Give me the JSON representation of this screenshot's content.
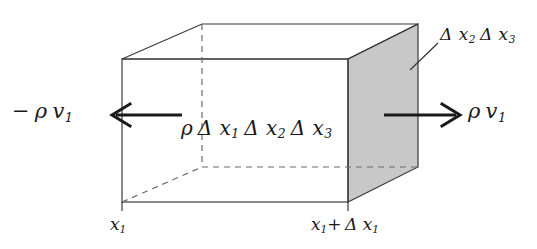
{
  "figure": {
    "type": "control-volume-box-diagram",
    "background_color": "#ffffff",
    "line_color": "#1a1a1a",
    "shaded_face_color": "#c8c8c8",
    "labels": {
      "flux_in": "−ρ v₁",
      "flux_in_parts": {
        "sign": "−",
        "density": "ρ",
        "velocity": "v",
        "velocity_sub": "1"
      },
      "flux_out": "ρ v₁",
      "flux_out_parts": {
        "density": "ρ",
        "velocity": "v",
        "velocity_sub": "1"
      },
      "volume": "ρ Δ x₁ Δ x₂ Δ x₃",
      "volume_parts": {
        "density": "ρ",
        "d1": "Δ x",
        "d1_sub": "1",
        "d2": "Δ x",
        "d2_sub": "2",
        "d3": "Δ x",
        "d3_sub": "3"
      },
      "area": "Δ x₂ Δ x₃",
      "area_parts": {
        "a1": "Δ x",
        "a1_sub": "2",
        "a2": "Δ x",
        "a2_sub": "3"
      },
      "x_left": "x₁",
      "x_left_parts": {
        "base": "x",
        "sub": "1"
      },
      "x_right": "x₁+ Δ x₁",
      "x_right_parts": {
        "base": "x",
        "sub1": "1",
        "op": "+",
        "delta": "Δ x",
        "sub2": "1"
      }
    },
    "geometry": {
      "front_face": {
        "left": 122,
        "right": 348,
        "top": 59,
        "bottom": 202
      },
      "back_offset": {
        "dx": 80,
        "dy": -35
      },
      "shaded_right_face": [
        [
          348,
          59
        ],
        [
          418,
          24
        ],
        [
          418,
          167
        ],
        [
          348,
          202
        ]
      ],
      "hidden_edges": [
        {
          "from": [
            202,
            24
          ],
          "to": [
            202,
            167
          ]
        },
        {
          "from": [
            202,
            167
          ],
          "to": [
            418,
            167
          ]
        },
        {
          "from": [
            122,
            202
          ],
          "to": [
            202,
            167
          ]
        }
      ],
      "leader_line": {
        "from": [
          410,
          70
        ],
        "to": [
          438,
          43
        ]
      },
      "arrow_in": {
        "tail": [
          180,
          115
        ],
        "head": [
          112,
          115
        ],
        "direction": "left"
      },
      "arrow_out": {
        "tail": [
          385,
          115
        ],
        "head": [
          460,
          115
        ],
        "direction": "right"
      },
      "tick_left": {
        "x": 122,
        "y_top": 202,
        "y_bottom": 210
      },
      "tick_right": {
        "x": 348,
        "y_top": 202,
        "y_bottom": 210
      }
    }
  }
}
